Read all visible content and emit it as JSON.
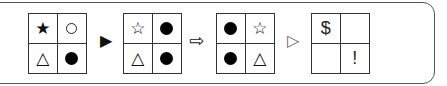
{
  "puzzle": {
    "grids": [
      {
        "cells": [
          "★",
          "ring",
          "△",
          "dot"
        ]
      },
      {
        "cells": [
          "☆",
          "dot",
          "△",
          "dot"
        ]
      },
      {
        "cells": [
          "dot",
          "☆",
          "dot",
          "△"
        ]
      },
      {
        "cells": [
          "$",
          "",
          "",
          "!"
        ]
      }
    ],
    "arrows": [
      "▶",
      "⇨",
      "▷"
    ]
  }
}
